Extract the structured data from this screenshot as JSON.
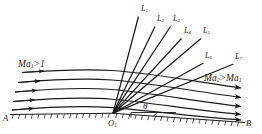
{
  "figure": {
    "name": "prandtl-meyer-expansion-fan",
    "background": "#ffffff",
    "stroke": "#1b1b1b",
    "width": 262,
    "height": 134
  },
  "labels": {
    "mach_upstream": "Ma",
    "mach_upstream_sub": "1",
    "mach_upstream_rel": ">1",
    "mach_downstream": "Ma",
    "mach_downstream_sub": "2",
    "mach_downstream_rel": ">Ma",
    "mach_downstream_sub2": "1",
    "point_a": "A",
    "point_b": "B",
    "corner": "O",
    "corner_sub": "1",
    "angle": "θ"
  },
  "expansion_lines": [
    {
      "label": "L",
      "sub": "1",
      "x": 141,
      "y": 9
    },
    {
      "label": "L",
      "sub": "2",
      "x": 158,
      "y": 19
    },
    {
      "label": "L",
      "sub": "3",
      "x": 173,
      "y": 19
    },
    {
      "label": "L",
      "sub": "4",
      "x": 184,
      "y": 31
    },
    {
      "label": "L",
      "sub": "5",
      "x": 204,
      "y": 31
    },
    {
      "label": "L",
      "sub": "6",
      "x": 206,
      "y": 56
    },
    {
      "label": "L",
      "sub": "7",
      "x": 236,
      "y": 57
    }
  ],
  "streamline_count": 5,
  "fan_origin": {
    "x": 113,
    "y": 113
  }
}
